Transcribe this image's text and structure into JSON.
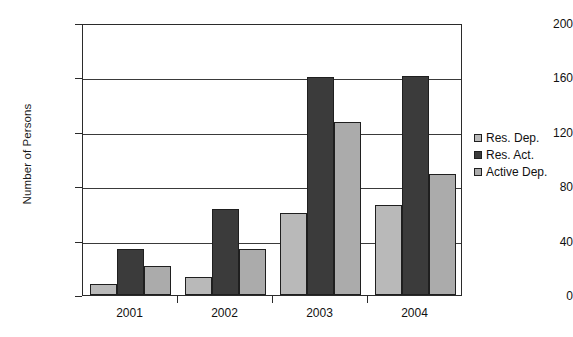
{
  "chart_data": {
    "type": "bar",
    "title": "",
    "xlabel": "",
    "ylabel": "Number of Persons",
    "categories": [
      "2001",
      "2002",
      "2003",
      "2004"
    ],
    "series": [
      {
        "name": "Res. Dep.",
        "values": [
          8,
          13,
          60,
          66
        ],
        "color": "#b9b9b9"
      },
      {
        "name": "Res. Act.",
        "values": [
          34,
          63,
          160,
          161
        ],
        "color": "#3b3b3b"
      },
      {
        "name": "Active Dep.",
        "values": [
          21,
          34,
          127,
          89
        ],
        "color": "#ababab"
      }
    ],
    "ylim": [
      0,
      200
    ],
    "yticks": [
      0,
      40,
      80,
      120,
      160,
      200
    ],
    "ytick_labels": [
      "0",
      "40",
      "80",
      "120",
      "160",
      "200"
    ],
    "grid": "horizontal",
    "legend_position": "right"
  }
}
